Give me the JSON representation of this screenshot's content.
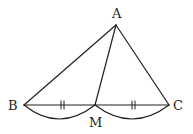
{
  "diagram": {
    "type": "geometry",
    "stroke_color": "#231f20",
    "points": {
      "A": {
        "label": "A",
        "x": 116,
        "y": 25
      },
      "B": {
        "label": "B",
        "x": 24,
        "y": 105
      },
      "C": {
        "label": "C",
        "x": 169,
        "y": 105
      },
      "M": {
        "label": "M",
        "x": 95,
        "y": 105
      }
    },
    "labels": {
      "A": "A",
      "B": "B",
      "C": "C",
      "M": "M"
    },
    "segments": [
      "AB",
      "AC",
      "AM",
      "BC"
    ],
    "equal_marks": {
      "BM": "||",
      "MC": "||"
    },
    "arcs": [
      "BM",
      "MC"
    ]
  }
}
